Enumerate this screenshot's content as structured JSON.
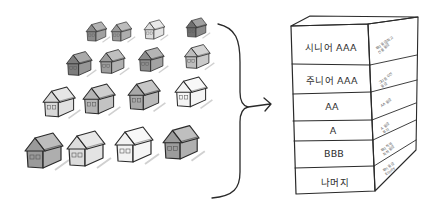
{
  "diagram": {
    "left_group": {
      "description": "Pool of hand-drawn houses (mortgage loans) arranged in 4 rows",
      "rows": [
        {
          "houses": [
            {
              "x": 97,
              "y": 40,
              "s": 0.55,
              "shade": "#8a8a8a"
            },
            {
              "x": 122,
              "y": 40,
              "s": 0.55,
              "shade": "#9a9a9a"
            },
            {
              "x": 155,
              "y": 38,
              "s": 0.55,
              "shade": "#dcdcdc"
            },
            {
              "x": 197,
              "y": 36,
              "s": 0.55,
              "shade": "#6f6f6f"
            }
          ]
        },
        {
          "houses": [
            {
              "x": 80,
              "y": 74,
              "s": 0.68,
              "shade": "#7d7d7d"
            },
            {
              "x": 113,
              "y": 72,
              "s": 0.68,
              "shade": "#9c9c9c"
            },
            {
              "x": 152,
              "y": 70,
              "s": 0.68,
              "shade": "#8c8c8c"
            },
            {
              "x": 198,
              "y": 67,
              "s": 0.68,
              "shade": "#bdbdbd"
            }
          ]
        },
        {
          "houses": [
            {
              "x": 60,
              "y": 115,
              "s": 0.85,
              "shade": "#d8d8d8"
            },
            {
              "x": 100,
              "y": 112,
              "s": 0.85,
              "shade": "#b4b4b4"
            },
            {
              "x": 145,
              "y": 108,
              "s": 0.85,
              "shade": "#a8a8a8"
            },
            {
              "x": 192,
              "y": 105,
              "s": 0.85,
              "shade": "#f4f4f4"
            }
          ]
        },
        {
          "houses": [
            {
              "x": 45,
              "y": 166,
              "s": 1.0,
              "shade": "#9a9a9a"
            },
            {
              "x": 87,
              "y": 164,
              "s": 1.0,
              "shade": "#dcdcdc"
            },
            {
              "x": 135,
              "y": 160,
              "s": 1.0,
              "shade": "#f2f2f2"
            },
            {
              "x": 182,
              "y": 157,
              "s": 0.95,
              "shade": "#9c9c9c"
            }
          ]
        }
      ]
    },
    "connector": {
      "type": "curly-brace-with-arrow",
      "arrow_direction": "right"
    },
    "stack": {
      "title": "Tranche stack",
      "tranches": [
        {
          "label": "시니어 AAA",
          "side_note": [
            "투자 등급/최고",
            "신용 등급"
          ]
        },
        {
          "label": "주니어 AAA",
          "side_note": [
            "그다음 우선",
            "등급"
          ]
        },
        {
          "label": "AA",
          "side_note": [
            "AA 등급"
          ]
        },
        {
          "label": "A",
          "side_note": [
            "A 등급",
            "투자"
          ]
        },
        {
          "label": "BBB",
          "side_note": [
            "투자 적격",
            "최하 등급"
          ]
        },
        {
          "label": "나머지",
          "side_note": [
            "투기 등급",
            "Equity"
          ]
        }
      ]
    },
    "colors": {
      "ink": "#2a2a2a",
      "paper": "#ffffff",
      "pencil_shade": "#9a9a9a"
    }
  }
}
